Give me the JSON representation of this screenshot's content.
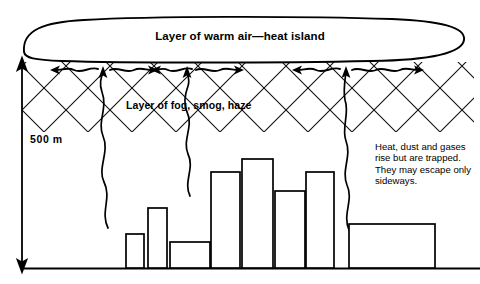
{
  "diagram": {
    "labels": {
      "cloud": "Layer of warm air—heat island",
      "haze": "Layer of fog, smog, haze",
      "scale": "500 m",
      "note": "Heat, dust and gases rise but are trapped. They may escape only sideways."
    },
    "colors": {
      "ink": "#000000",
      "background": "#ffffff",
      "hatch": "#1a1a1a"
    },
    "axis": {
      "label": "500 m",
      "x": 22,
      "top_y": 60,
      "bottom_y": 268,
      "arrow_ends": "both"
    },
    "ground": {
      "y": 268,
      "x_start": 22,
      "x_end": 480
    },
    "warm_air_cloud": {
      "shape": "lens",
      "x_left": 20,
      "x_right": 466,
      "y_top": 18,
      "y_bottom": 62
    },
    "haze_layer": {
      "y_top": 62,
      "y_bottom": 132,
      "pattern": "crosshatch-x"
    },
    "buildings": [
      {
        "name": "building-1",
        "x": 126,
        "width": 18,
        "top": 234
      },
      {
        "name": "building-2",
        "x": 148,
        "width": 19,
        "top": 208
      },
      {
        "name": "building-3",
        "x": 170,
        "width": 40,
        "top": 242
      },
      {
        "name": "building-4",
        "x": 211,
        "width": 29,
        "top": 172
      },
      {
        "name": "building-5",
        "x": 242,
        "width": 31,
        "top": 159
      },
      {
        "name": "building-6",
        "x": 275,
        "width": 30,
        "top": 191
      },
      {
        "name": "building-7",
        "x": 306,
        "width": 28,
        "top": 172
      },
      {
        "name": "building-8",
        "x": 349,
        "width": 86,
        "top": 224
      }
    ],
    "smoke_plumes": [
      {
        "name": "smoke-plume-left",
        "x": 105
      },
      {
        "name": "smoke-plume-center",
        "x": 190
      },
      {
        "name": "smoke-plume-right",
        "x": 345
      }
    ],
    "wind_arrows": [
      {
        "name": "wind-arrow-1",
        "direction": "left",
        "x": 36,
        "y": 70
      },
      {
        "name": "wind-arrow-2",
        "direction": "right",
        "x": 108,
        "y": 70
      },
      {
        "name": "wind-arrow-3",
        "direction": "left",
        "x": 152,
        "y": 70
      },
      {
        "name": "wind-arrow-4",
        "direction": "right",
        "x": 200,
        "y": 70
      },
      {
        "name": "wind-arrow-5",
        "direction": "left",
        "x": 296,
        "y": 70
      },
      {
        "name": "wind-arrow-6",
        "direction": "right",
        "x": 380,
        "y": 70
      }
    ]
  }
}
